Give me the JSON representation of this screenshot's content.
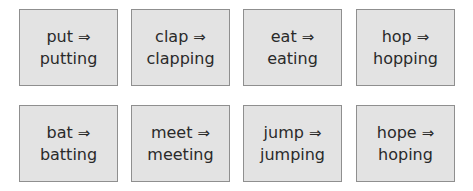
{
  "cards": [
    {
      "base": "put",
      "arrow": "⇒",
      "result": "putting"
    },
    {
      "base": "clap",
      "arrow": "⇒",
      "result": "clapping"
    },
    {
      "base": "eat",
      "arrow": "⇒",
      "result": "eating"
    },
    {
      "base": "hop",
      "arrow": "⇒",
      "result": "hopping"
    },
    {
      "base": "bat",
      "arrow": "⇒",
      "result": "batting"
    },
    {
      "base": "meet",
      "arrow": "⇒",
      "result": "meeting"
    },
    {
      "base": "jump",
      "arrow": "⇒",
      "result": "jumping"
    },
    {
      "base": "hope",
      "arrow": "⇒",
      "result": "hoping"
    }
  ]
}
